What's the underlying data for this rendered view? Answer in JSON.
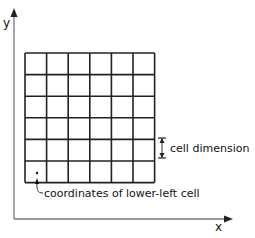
{
  "diagram": {
    "axes": {
      "x_label": "x",
      "y_label": "y"
    },
    "grid": {
      "rows": 6,
      "cols": 6,
      "left": 25,
      "top": 53,
      "cell": 21.6
    },
    "annotations": {
      "cell_dimension": "cell dimension",
      "lower_left": "coordinates of lower-left cell"
    },
    "colors": {
      "axis": "#666666",
      "grid": "#222222",
      "text": "#111111"
    }
  }
}
